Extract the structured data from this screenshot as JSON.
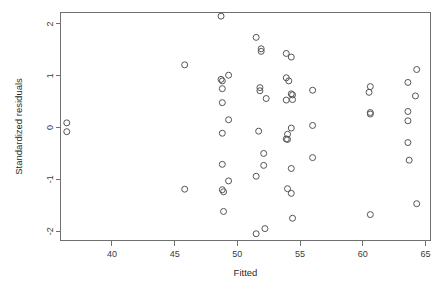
{
  "figure": {
    "background_color": "#ffffff",
    "frame_color": "#707070",
    "marker_color": "#555555",
    "text_color": "#3a3a3a"
  },
  "chart_data": {
    "type": "scatter",
    "title": "",
    "xlabel": "Fitted",
    "ylabel": "Standardized residuals",
    "xlim": [
      35.9,
      65.4
    ],
    "ylim": [
      -2.18,
      2.22
    ],
    "xticks": [
      40,
      45,
      50,
      55,
      60,
      65
    ],
    "xticklabels": [
      "40",
      "45",
      "50",
      "55",
      "60",
      "65"
    ],
    "yticks": [
      2,
      1,
      0,
      -1,
      -2
    ],
    "yticklabels": [
      "2",
      "1",
      "0",
      "-1",
      "-2"
    ],
    "grid": false,
    "legend": null,
    "marker": "open-circle",
    "marker_size": 3,
    "n_points": 75,
    "points": [
      [
        36.4,
        0.09
      ],
      [
        36.4,
        -0.08
      ],
      [
        45.8,
        1.21
      ],
      [
        45.8,
        -1.19
      ],
      [
        48.7,
        2.15
      ],
      [
        48.7,
        0.93
      ],
      [
        48.8,
        0.9
      ],
      [
        49.3,
        1.01
      ],
      [
        48.8,
        0.75
      ],
      [
        48.8,
        0.48
      ],
      [
        49.3,
        0.15
      ],
      [
        48.8,
        -0.11
      ],
      [
        48.8,
        -0.71
      ],
      [
        49.3,
        -1.03
      ],
      [
        48.8,
        -1.2
      ],
      [
        48.9,
        -1.24
      ],
      [
        48.9,
        -1.62
      ],
      [
        51.5,
        1.74
      ],
      [
        51.9,
        1.52
      ],
      [
        51.9,
        1.47
      ],
      [
        51.8,
        0.77
      ],
      [
        51.8,
        0.71
      ],
      [
        52.3,
        0.56
      ],
      [
        51.7,
        -0.07
      ],
      [
        51.5,
        -0.94
      ],
      [
        52.1,
        -0.5
      ],
      [
        52.1,
        -0.73
      ],
      [
        51.5,
        -2.05
      ],
      [
        52.2,
        -1.95
      ],
      [
        53.9,
        1.43
      ],
      [
        54.3,
        1.36
      ],
      [
        53.9,
        0.96
      ],
      [
        54.1,
        0.9
      ],
      [
        54.3,
        0.65
      ],
      [
        54.4,
        0.63
      ],
      [
        53.9,
        0.53
      ],
      [
        54.4,
        0.54
      ],
      [
        54.0,
        -0.13
      ],
      [
        54.3,
        -0.01
      ],
      [
        53.9,
        -0.22
      ],
      [
        54.0,
        -0.23
      ],
      [
        54.3,
        -0.79
      ],
      [
        54.0,
        -1.18
      ],
      [
        54.3,
        -1.27
      ],
      [
        54.4,
        -1.75
      ],
      [
        56.0,
        0.72
      ],
      [
        56.0,
        0.04
      ],
      [
        56.0,
        -0.58
      ],
      [
        60.6,
        0.79
      ],
      [
        60.5,
        0.68
      ],
      [
        60.6,
        0.29
      ],
      [
        60.6,
        0.26
      ],
      [
        60.6,
        -1.68
      ],
      [
        63.6,
        0.87
      ],
      [
        64.3,
        1.12
      ],
      [
        64.2,
        0.61
      ],
      [
        63.6,
        0.31
      ],
      [
        63.6,
        0.13
      ],
      [
        63.6,
        -0.29
      ],
      [
        63.7,
        -0.63
      ],
      [
        64.3,
        -1.47
      ]
    ]
  }
}
